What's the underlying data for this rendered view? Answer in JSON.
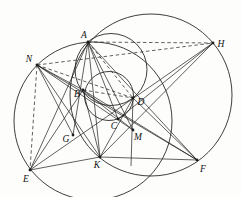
{
  "figure": {
    "width": 241,
    "height": 197,
    "background": "#fdfdfc",
    "stroke_color": "#1c1c1c",
    "label_font_size": 9.5,
    "point_labels": [
      "A",
      "B",
      "C",
      "D",
      "E",
      "F",
      "G",
      "H",
      "K",
      "M",
      "N"
    ],
    "points": {
      "A": [
        88,
        42
      ],
      "B": [
        83,
        90
      ],
      "C": [
        118,
        119
      ],
      "D": [
        133,
        98
      ],
      "E": [
        30,
        170
      ],
      "F": [
        197,
        160
      ],
      "G": [
        73,
        135
      ],
      "H": [
        213,
        43
      ],
      "K": [
        100,
        157
      ],
      "M": [
        133,
        130
      ],
      "N": [
        37,
        65
      ]
    },
    "labels": [
      {
        "text": "A",
        "x": 84,
        "y": 38
      },
      {
        "text": "N",
        "x": 29,
        "y": 62
      },
      {
        "text": "H",
        "x": 221,
        "y": 47
      },
      {
        "text": "B",
        "x": 77,
        "y": 97
      },
      {
        "text": "D",
        "x": 141,
        "y": 105
      },
      {
        "text": "C",
        "x": 114,
        "y": 129
      },
      {
        "text": "M",
        "x": 138,
        "y": 140
      },
      {
        "text": "G",
        "x": 66,
        "y": 142
      },
      {
        "text": "K",
        "x": 97,
        "y": 168
      },
      {
        "text": "E",
        "x": 26,
        "y": 182
      },
      {
        "text": "F",
        "x": 203,
        "y": 172
      }
    ],
    "circles": [
      {
        "name": "left-large-circle",
        "cx": 93,
        "cy": 121,
        "r": 79
      },
      {
        "name": "right-large-circle",
        "cx": 151,
        "cy": 95,
        "r": 81
      },
      {
        "name": "medium-circle-ABD",
        "cx": 111,
        "cy": 69.5,
        "r": 36
      },
      {
        "name": "small-circle-BCD",
        "cx": 109,
        "cy": 96,
        "r": 24.5
      }
    ],
    "solid_lines": [
      [
        "E",
        "H"
      ],
      [
        "A",
        "G"
      ],
      [
        "A",
        "C"
      ],
      [
        "A",
        "M"
      ],
      [
        "A",
        "F"
      ],
      [
        "A",
        "K"
      ],
      [
        "N",
        "B"
      ],
      [
        "N",
        "G"
      ],
      [
        "N",
        "K"
      ],
      [
        "N",
        "M"
      ],
      [
        "N",
        "F"
      ],
      [
        "E",
        "A"
      ],
      [
        "E",
        "B"
      ],
      [
        "E",
        "K"
      ],
      [
        "K",
        "F"
      ],
      [
        "B",
        "K"
      ],
      [
        "B",
        "M"
      ],
      [
        "B",
        "F"
      ],
      [
        "H",
        "K"
      ],
      [
        "H",
        "C"
      ],
      [
        "D",
        "F"
      ],
      [
        "D",
        "K"
      ]
    ],
    "dashed_lines": [
      [
        "N",
        "H"
      ],
      [
        "A",
        "H"
      ],
      [
        "N",
        "E"
      ],
      [
        "N",
        "D"
      ],
      [
        "B",
        "D"
      ],
      [
        "A",
        "D"
      ]
    ],
    "extra_segments": [
      {
        "name": "segment-D-M-extended",
        "from": "D",
        "to": [
          131,
          166
        ]
      }
    ],
    "style": {
      "line_width": 0.7,
      "circle_width": 0.85,
      "dash_pattern": "3.5 2.6",
      "dot_radius": 1.4
    }
  }
}
